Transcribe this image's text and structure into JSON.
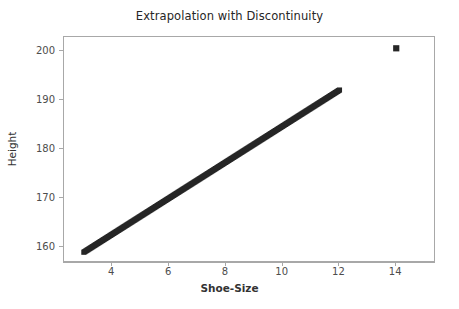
{
  "chart_data": {
    "type": "scatter",
    "title": "Extrapolation with Discontinuity",
    "xlabel": "Shoe-Size",
    "ylabel": "Height",
    "xlim": [
      2.3,
      15.4
    ],
    "ylim": [
      156.8,
      202.8
    ],
    "grid": false,
    "legend": null,
    "xticks": [
      4,
      6,
      8,
      10,
      12,
      14
    ],
    "xtick_labels": [
      "4",
      "6",
      "8",
      "10",
      "12",
      "14"
    ],
    "yticks": [
      160,
      170,
      180,
      190,
      200
    ],
    "ytick_labels": [
      "160",
      "170",
      "180",
      "190",
      "200"
    ],
    "marker": "square",
    "marker_color": "#262626",
    "series": [
      {
        "name": "fitted-trend",
        "description": "dense square markers forming a continuous line",
        "x": [
          3.0,
          3.2,
          3.4,
          3.6,
          3.8,
          4.0,
          4.2,
          4.4,
          4.6,
          4.8,
          5.0,
          5.2,
          5.4,
          5.6,
          5.8,
          6.0,
          6.2,
          6.4,
          6.6,
          6.8,
          7.0,
          7.2,
          7.4,
          7.6,
          7.8,
          8.0,
          8.2,
          8.4,
          8.6,
          8.8,
          9.0,
          9.2,
          9.4,
          9.6,
          9.8,
          10.0,
          10.2,
          10.4,
          10.6,
          10.8,
          11.0,
          11.2,
          11.4,
          11.6,
          11.8,
          12.0
        ],
        "y": [
          159.0,
          159.7,
          160.5,
          161.2,
          161.9,
          162.7,
          163.4,
          164.1,
          164.9,
          165.6,
          166.3,
          167.1,
          167.8,
          168.5,
          169.3,
          170.0,
          170.7,
          171.5,
          172.2,
          172.9,
          173.7,
          174.4,
          175.1,
          175.9,
          176.6,
          177.3,
          178.1,
          178.8,
          179.5,
          180.3,
          181.0,
          181.7,
          182.5,
          183.2,
          183.9,
          184.7,
          185.4,
          186.1,
          186.9,
          187.6,
          188.3,
          189.1,
          189.8,
          190.5,
          191.3,
          192.0
        ]
      },
      {
        "name": "discontinuity-point",
        "description": "isolated outlier marker",
        "x": [
          14.0
        ],
        "y": [
          200.5
        ]
      }
    ]
  },
  "figure": {
    "background_color": "#ffffff",
    "frame_color": "#a8a8a8",
    "data_color": "#262626",
    "tick_text_color": "#4d4d4d"
  }
}
